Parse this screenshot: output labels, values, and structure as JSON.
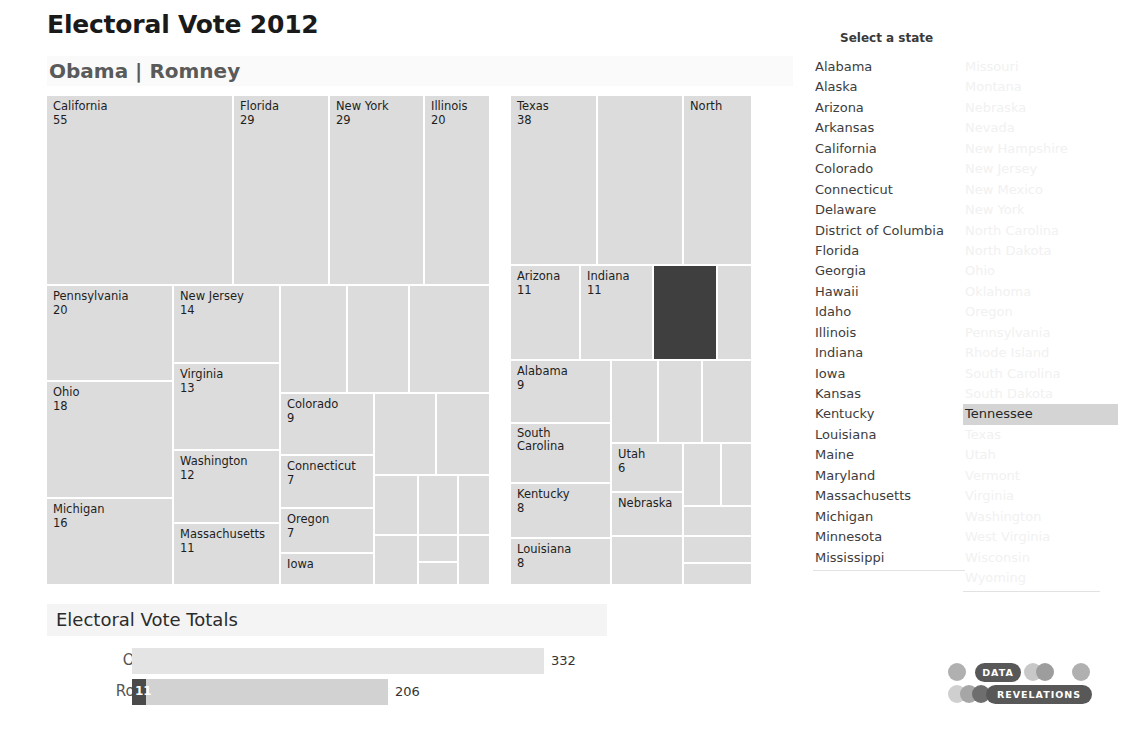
{
  "header": {
    "title": "Electoral Vote 2012",
    "subtitle": "Obama | Romney"
  },
  "state_selector": {
    "label": "Select a state",
    "selected": "Tennessee",
    "column_1": [
      "Alabama",
      "Alaska",
      "Arizona",
      "Arkansas",
      "California",
      "Colorado",
      "Connecticut",
      "Delaware",
      "District of Columbia",
      "Florida",
      "Georgia",
      "Hawaii",
      "Idaho",
      "Illinois",
      "Indiana",
      "Iowa",
      "Kansas",
      "Kentucky",
      "Louisiana",
      "Maine",
      "Maryland",
      "Massachusetts",
      "Michigan",
      "Minnesota",
      "Mississippi"
    ],
    "column_2": [
      "Missouri",
      "Montana",
      "Nebraska",
      "Nevada",
      "New Hampshire",
      "New Jersey",
      "New Mexico",
      "New York",
      "North Carolina",
      "North Dakota",
      "Ohio",
      "Oklahoma",
      "Oregon",
      "Pennsylvania",
      "Rhode Island",
      "South Carolina",
      "South Dakota",
      "Tennessee",
      "Texas",
      "Utah",
      "Vermont",
      "Virginia",
      "Washington",
      "West Virginia",
      "Wisconsin",
      "Wyoming"
    ]
  },
  "bars": {
    "section_title": "Electoral Vote Totals",
    "rows": [
      {
        "name": "Obama",
        "total": "332",
        "value": 332,
        "selected_value": null,
        "selected_label": ""
      },
      {
        "name": "Romney",
        "total": "206",
        "value": 206,
        "selected_value": 11,
        "selected_label": "11"
      }
    ],
    "axis_max": 332
  },
  "logo": {
    "line1": "DATA",
    "line2": "REVELATIONS"
  },
  "colors": {
    "cell": "#dcdcdc",
    "cell_selected": "#3f3f3f",
    "bar_obama": "#e4e4e4",
    "bar_romney": "#d2d2d2",
    "bar_selected": "#4a4a4a",
    "list_selected_bg": "#d4d4d4"
  },
  "chart_data": {
    "type": "treemap",
    "title": "Electoral Vote 2012",
    "subtitle": "Obama | Romney",
    "groups": [
      {
        "name": "Obama",
        "total": 332,
        "states": [
          {
            "state": "California",
            "votes": 55,
            "label_shown": true
          },
          {
            "state": "Florida",
            "votes": 29,
            "label_shown": true
          },
          {
            "state": "New York",
            "votes": 29,
            "label_shown": true
          },
          {
            "state": "Illinois",
            "votes": 20,
            "label_shown": true
          },
          {
            "state": "Pennsylvania",
            "votes": 20,
            "label_shown": true
          },
          {
            "state": "Ohio",
            "votes": 18,
            "label_shown": true
          },
          {
            "state": "Michigan",
            "votes": 16,
            "label_shown": true
          },
          {
            "state": "New Jersey",
            "votes": 14,
            "label_shown": true
          },
          {
            "state": "Virginia",
            "votes": 13,
            "label_shown": true
          },
          {
            "state": "Washington",
            "votes": 12,
            "label_shown": true
          },
          {
            "state": "Massachusetts",
            "votes": 11,
            "label_shown": true
          },
          {
            "state": "Colorado",
            "votes": 9,
            "label_shown": true
          },
          {
            "state": "Connecticut",
            "votes": 7,
            "label_shown": true
          },
          {
            "state": "Oregon",
            "votes": 7,
            "label_shown": true
          },
          {
            "state": "Iowa",
            "votes": 6,
            "label_shown": true
          },
          {
            "state": "Wisconsin",
            "votes": 10,
            "label_shown": false
          },
          {
            "state": "Minnesota",
            "votes": 10,
            "label_shown": false
          },
          {
            "state": "Maryland",
            "votes": 10,
            "label_shown": false
          },
          {
            "state": "Nevada",
            "votes": 6,
            "label_shown": false
          },
          {
            "state": "New Mexico",
            "votes": 5,
            "label_shown": false
          },
          {
            "state": "Hawaii",
            "votes": 4,
            "label_shown": false
          },
          {
            "state": "Maine",
            "votes": 4,
            "label_shown": false
          },
          {
            "state": "New Hampshire",
            "votes": 4,
            "label_shown": false
          },
          {
            "state": "Rhode Island",
            "votes": 4,
            "label_shown": false
          },
          {
            "state": "Delaware",
            "votes": 3,
            "label_shown": false
          },
          {
            "state": "District of Columbia",
            "votes": 3,
            "label_shown": false
          },
          {
            "state": "Vermont",
            "votes": 3,
            "label_shown": false
          }
        ]
      },
      {
        "name": "Romney",
        "total": 206,
        "states": [
          {
            "state": "Texas",
            "votes": 38,
            "label_shown": true
          },
          {
            "state": "Georgia",
            "votes": 16,
            "label_shown": false
          },
          {
            "state": "North Carolina",
            "votes": 15,
            "label_shown": true,
            "label_text": "North"
          },
          {
            "state": "Arizona",
            "votes": 11,
            "label_shown": true
          },
          {
            "state": "Indiana",
            "votes": 11,
            "label_shown": true
          },
          {
            "state": "Tennessee",
            "votes": 11,
            "label_shown": false,
            "selected": true
          },
          {
            "state": "Missouri",
            "votes": 10,
            "label_shown": false
          },
          {
            "state": "Alabama",
            "votes": 9,
            "label_shown": true
          },
          {
            "state": "South Carolina",
            "votes": 9,
            "label_shown": true
          },
          {
            "state": "Kentucky",
            "votes": 8,
            "label_shown": true
          },
          {
            "state": "Louisiana",
            "votes": 8,
            "label_shown": true
          },
          {
            "state": "Oklahoma",
            "votes": 7,
            "label_shown": false
          },
          {
            "state": "Arkansas",
            "votes": 6,
            "label_shown": false
          },
          {
            "state": "Kansas",
            "votes": 6,
            "label_shown": false
          },
          {
            "state": "Mississippi",
            "votes": 6,
            "label_shown": false
          },
          {
            "state": "Utah",
            "votes": 6,
            "label_shown": true
          },
          {
            "state": "Nebraska",
            "votes": 5,
            "label_shown": true
          },
          {
            "state": "West Virginia",
            "votes": 5,
            "label_shown": false
          },
          {
            "state": "Idaho",
            "votes": 4,
            "label_shown": false
          },
          {
            "state": "Montana",
            "votes": 3,
            "label_shown": false
          },
          {
            "state": "North Dakota",
            "votes": 3,
            "label_shown": false
          },
          {
            "state": "South Dakota",
            "votes": 3,
            "label_shown": false
          },
          {
            "state": "Alaska",
            "votes": 3,
            "label_shown": false
          },
          {
            "state": "Wyoming",
            "votes": 3,
            "label_shown": false
          }
        ]
      }
    ],
    "bar_chart": {
      "type": "bar",
      "orientation": "horizontal",
      "title": "Electoral Vote Totals",
      "categories": [
        "Obama",
        "Romney"
      ],
      "values": [
        332,
        206
      ],
      "highlight": {
        "category": "Romney",
        "state": "Tennessee",
        "value": 11
      }
    }
  },
  "treemap_layout": {
    "obama": [
      {
        "x": 0,
        "y": 0,
        "w": 187,
        "h": 190,
        "label": "California",
        "val": "55"
      },
      {
        "x": 187,
        "y": 0,
        "w": 96,
        "h": 190,
        "label": "Florida",
        "val": "29"
      },
      {
        "x": 187,
        "y": 0,
        "w": 0,
        "h": 0,
        "label": "",
        "val": ""
      },
      {
        "x": 283,
        "y": 0,
        "w": 95,
        "h": 190,
        "label": "New York",
        "val": "29"
      },
      {
        "x": 378,
        "y": 0,
        "w": 66,
        "h": 190,
        "label": "Illinois",
        "val": "20"
      },
      {
        "x": 0,
        "y": 190,
        "w": 127,
        "h": 96,
        "label": "Pennsylvania",
        "val": "20"
      },
      {
        "x": 0,
        "y": 286,
        "w": 127,
        "h": 117,
        "label": "Ohio",
        "val": "18"
      },
      {
        "x": 0,
        "y": 403,
        "w": 127,
        "h": 87,
        "label": "Michigan",
        "val": "16"
      },
      {
        "x": 127,
        "y": 190,
        "w": 107,
        "h": 78,
        "label": "New Jersey",
        "val": "14"
      },
      {
        "x": 127,
        "y": 268,
        "w": 107,
        "h": 87,
        "label": "Virginia",
        "val": "13"
      },
      {
        "x": 127,
        "y": 355,
        "w": 107,
        "h": 73,
        "label": "Washington",
        "val": "12"
      },
      {
        "x": 127,
        "y": 428,
        "w": 107,
        "h": 62,
        "label": "Massachusetts",
        "val": "11"
      },
      {
        "x": 234,
        "y": 298,
        "w": 94,
        "h": 62,
        "label": "Colorado",
        "val": "9"
      },
      {
        "x": 234,
        "y": 360,
        "w": 94,
        "h": 53,
        "label": "Connecticut",
        "val": "7"
      },
      {
        "x": 234,
        "y": 413,
        "w": 94,
        "h": 45,
        "label": "Oregon",
        "val": "7"
      },
      {
        "x": 234,
        "y": 458,
        "w": 94,
        "h": 32,
        "label": "Iowa",
        "val": ""
      },
      {
        "x": 234,
        "y": 190,
        "w": 67,
        "h": 108,
        "label": "",
        "val": ""
      },
      {
        "x": 301,
        "y": 190,
        "w": 62,
        "h": 108,
        "label": "",
        "val": ""
      },
      {
        "x": 363,
        "y": 190,
        "w": 81,
        "h": 108,
        "label": "",
        "val": ""
      },
      {
        "x": 328,
        "y": 298,
        "w": 62,
        "h": 82,
        "label": "",
        "val": ""
      },
      {
        "x": 390,
        "y": 298,
        "w": 54,
        "h": 82,
        "label": "",
        "val": ""
      },
      {
        "x": 328,
        "y": 380,
        "w": 44,
        "h": 60,
        "label": "",
        "val": ""
      },
      {
        "x": 372,
        "y": 380,
        "w": 40,
        "h": 60,
        "label": "",
        "val": ""
      },
      {
        "x": 412,
        "y": 380,
        "w": 32,
        "h": 60,
        "label": "",
        "val": ""
      },
      {
        "x": 328,
        "y": 440,
        "w": 44,
        "h": 50,
        "label": "",
        "val": ""
      },
      {
        "x": 372,
        "y": 440,
        "w": 40,
        "h": 27,
        "label": "",
        "val": ""
      },
      {
        "x": 372,
        "y": 467,
        "w": 40,
        "h": 23,
        "label": "",
        "val": ""
      },
      {
        "x": 412,
        "y": 440,
        "w": 32,
        "h": 50,
        "label": "",
        "val": ""
      }
    ],
    "romney": [
      {
        "x": 0,
        "y": 0,
        "w": 87,
        "h": 170,
        "label": "Texas",
        "val": "38"
      },
      {
        "x": 87,
        "y": 0,
        "w": 86,
        "h": 170,
        "label": "",
        "val": ""
      },
      {
        "x": 173,
        "y": 0,
        "w": 69,
        "h": 170,
        "label": "North",
        "val": ""
      },
      {
        "x": 0,
        "y": 170,
        "w": 70,
        "h": 95,
        "label": "Arizona",
        "val": "11"
      },
      {
        "x": 70,
        "y": 170,
        "w": 73,
        "h": 95,
        "label": "Indiana",
        "val": "11"
      },
      {
        "x": 143,
        "y": 170,
        "w": 64,
        "h": 95,
        "label": "",
        "val": "",
        "selected": true
      },
      {
        "x": 207,
        "y": 170,
        "w": 35,
        "h": 95,
        "label": "",
        "val": ""
      },
      {
        "x": 0,
        "y": 265,
        "w": 101,
        "h": 63,
        "label": "Alabama",
        "val": "9"
      },
      {
        "x": 0,
        "y": 328,
        "w": 101,
        "h": 60,
        "label": "South\nCarolina",
        "val": ""
      },
      {
        "x": 0,
        "y": 388,
        "w": 101,
        "h": 55,
        "label": "Kentucky",
        "val": "8"
      },
      {
        "x": 0,
        "y": 443,
        "w": 101,
        "h": 47,
        "label": "Louisiana",
        "val": "8"
      },
      {
        "x": 101,
        "y": 265,
        "w": 47,
        "h": 83,
        "label": "",
        "val": ""
      },
      {
        "x": 148,
        "y": 265,
        "w": 44,
        "h": 83,
        "label": "",
        "val": ""
      },
      {
        "x": 192,
        "y": 265,
        "w": 50,
        "h": 83,
        "label": "",
        "val": ""
      },
      {
        "x": 101,
        "y": 348,
        "w": 72,
        "h": 49,
        "label": "Utah",
        "val": "6"
      },
      {
        "x": 101,
        "y": 397,
        "w": 72,
        "h": 44,
        "label": "Nebraska",
        "val": ""
      },
      {
        "x": 101,
        "y": 441,
        "w": 72,
        "h": 49,
        "label": "",
        "val": ""
      },
      {
        "x": 173,
        "y": 348,
        "w": 38,
        "h": 63,
        "label": "",
        "val": ""
      },
      {
        "x": 211,
        "y": 348,
        "w": 31,
        "h": 63,
        "label": "",
        "val": ""
      },
      {
        "x": 173,
        "y": 411,
        "w": 69,
        "h": 30,
        "label": "",
        "val": ""
      },
      {
        "x": 173,
        "y": 441,
        "w": 69,
        "h": 27,
        "label": "",
        "val": ""
      },
      {
        "x": 173,
        "y": 468,
        "w": 69,
        "h": 22,
        "label": "",
        "val": ""
      }
    ]
  }
}
